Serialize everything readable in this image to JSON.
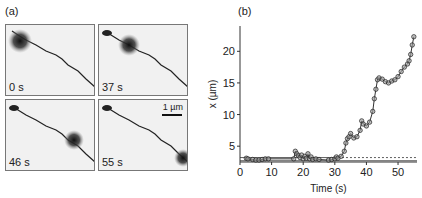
{
  "panel_a": {
    "label": "(a)",
    "frames": [
      {
        "time": "0 s",
        "spot": {
          "x": 14,
          "y": 16
        }
      },
      {
        "time": "37 s",
        "spot": {
          "x": 30,
          "y": 20
        }
      },
      {
        "time": "46 s",
        "spot": {
          "x": 68,
          "y": 40
        }
      },
      {
        "time": "55 s",
        "spot": {
          "x": 84,
          "y": 58
        }
      }
    ],
    "scale_bar": "1 µm"
  },
  "panel_b": {
    "label": "(b)"
  },
  "chart_data": {
    "type": "scatter",
    "title": "",
    "xlabel": "Time (s)",
    "ylabel": "x (µm)",
    "xlim": [
      0,
      56
    ],
    "ylim": [
      2.5,
      24
    ],
    "xticks": [
      0,
      10,
      20,
      30,
      40,
      50
    ],
    "yticks": [
      5,
      10,
      15,
      20
    ],
    "grid": false,
    "reference_lines": [
      {
        "style": "solid",
        "y": 3.2,
        "x_range": [
          0,
          31
        ]
      },
      {
        "style": "solid",
        "y": 2.7,
        "x_range": [
          0,
          56
        ]
      },
      {
        "style": "dashed",
        "y": 3.2,
        "x_range": [
          31,
          56
        ]
      }
    ],
    "series": [
      {
        "name": "position",
        "x": [
          2,
          2.5,
          4,
          5,
          6,
          7,
          8,
          9,
          17,
          17.5,
          18,
          18.5,
          19,
          19.5,
          20,
          20.5,
          21,
          21.5,
          22,
          22.5,
          23,
          24,
          25,
          28,
          29,
          30,
          30.5,
          31,
          32,
          33,
          33.5,
          34,
          34.5,
          35,
          36,
          37,
          38,
          38.5,
          39,
          40,
          41,
          42,
          42.5,
          43,
          43.5,
          44,
          45,
          46,
          47,
          48,
          49,
          50,
          51,
          52,
          53,
          53.5,
          54,
          54.5,
          55
        ],
        "y": [
          3.1,
          3.0,
          2.9,
          2.8,
          2.8,
          2.9,
          3.0,
          3.0,
          3.0,
          4.2,
          3.8,
          3.5,
          3.2,
          3.6,
          3.0,
          3.4,
          3.1,
          3.8,
          3.0,
          3.3,
          2.9,
          3.0,
          2.9,
          2.8,
          2.9,
          3.0,
          3.3,
          3.1,
          3.4,
          4.2,
          5.5,
          6.2,
          6.5,
          7.0,
          6.3,
          6.5,
          7.5,
          9.0,
          8.5,
          8.2,
          8.8,
          10.5,
          12.5,
          14.0,
          15.5,
          15.8,
          15.6,
          15.2,
          15.0,
          15.3,
          15.5,
          16.0,
          16.8,
          17.5,
          18.0,
          18.5,
          19.5,
          21.0,
          22.3
        ]
      }
    ]
  }
}
